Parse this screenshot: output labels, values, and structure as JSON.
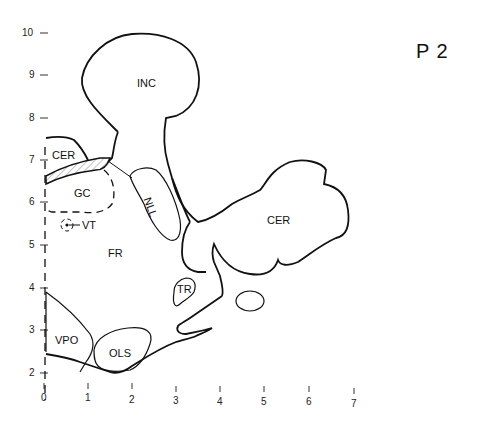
{
  "plate": {
    "label": "P  2"
  },
  "axes": {
    "y_ticks": [
      {
        "label": "10",
        "y": 33
      },
      {
        "label": "9",
        "y": 75
      },
      {
        "label": "8",
        "y": 118
      },
      {
        "label": "7",
        "y": 160
      },
      {
        "label": "6",
        "y": 202
      },
      {
        "label": "5",
        "y": 245
      },
      {
        "label": "4",
        "y": 288
      },
      {
        "label": "3",
        "y": 330
      },
      {
        "label": "2",
        "y": 373
      }
    ],
    "x_ticks": [
      {
        "label": "0",
        "x": 44
      },
      {
        "label": "1",
        "x": 88
      },
      {
        "label": "2",
        "x": 132
      },
      {
        "label": "3",
        "x": 176
      },
      {
        "label": "4",
        "x": 220
      },
      {
        "label": "5",
        "x": 264
      },
      {
        "label": "6",
        "x": 308
      },
      {
        "label": "7",
        "x": 354
      }
    ]
  },
  "regions": {
    "inc": "INC",
    "cer_left": "CER",
    "gc": "GC",
    "nll": "NLL",
    "vt": "VT",
    "fr": "FR",
    "cer_right": "CER",
    "tr": "TR",
    "vpo": "VPO",
    "ols": "OLS"
  }
}
